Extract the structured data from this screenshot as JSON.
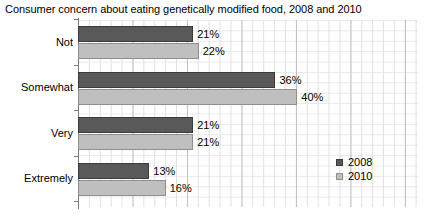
{
  "chart_data": {
    "type": "bar",
    "orientation": "horizontal",
    "title": "Consumer concern about eating genetically modified food, 2008 and 2010",
    "xlabel": "",
    "ylabel": "",
    "categories": [
      "Not",
      "Somewhat",
      "Very",
      "Extremely"
    ],
    "series": [
      {
        "name": "2008",
        "color": "#595959",
        "values": [
          21,
          36,
          21,
          13
        ],
        "value_labels": [
          "21%",
          "36%",
          "21%",
          "13%"
        ]
      },
      {
        "name": "2010",
        "color": "#bfbfbf",
        "values": [
          22,
          40,
          21,
          16
        ],
        "value_labels": [
          "22%",
          "40%",
          "21%",
          "16%"
        ]
      }
    ],
    "xlim": [
      0,
      62
    ],
    "unit": "%",
    "grid": true,
    "axis_tick_labels": [],
    "legend_position": "inside-bottom-right"
  },
  "legend": {
    "items": [
      {
        "label": "2008",
        "key": "s2008"
      },
      {
        "label": "2010",
        "key": "s2010"
      }
    ]
  }
}
